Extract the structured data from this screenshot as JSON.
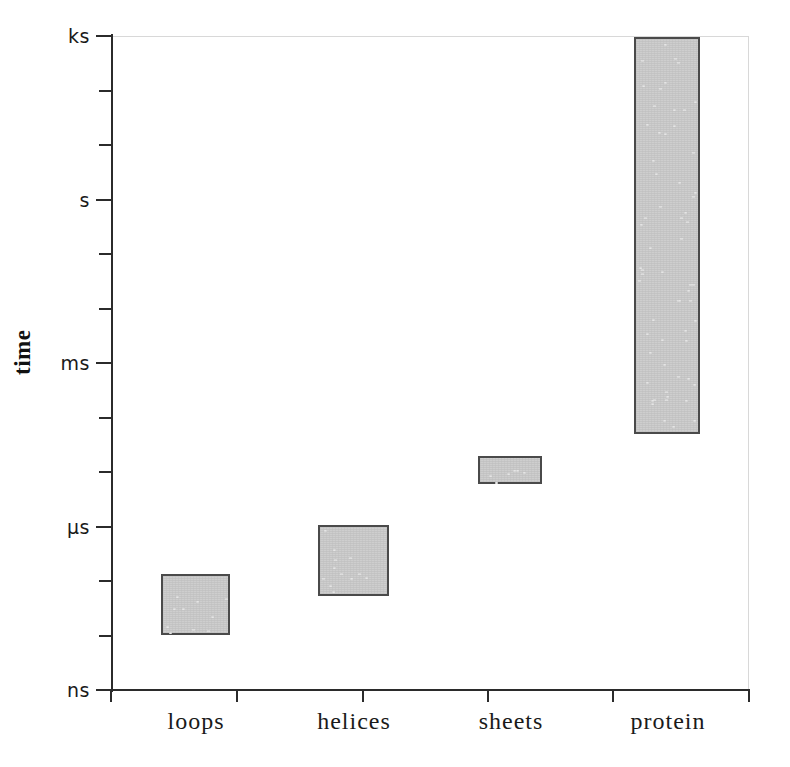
{
  "chart_data": {
    "type": "bar",
    "title": "",
    "subtitle": "",
    "xlabel": "",
    "ylabel": "time",
    "categories": [
      "loops",
      "helices",
      "sheets",
      "protein"
    ],
    "y_axis": {
      "scale": "log",
      "unit": "time",
      "major_tick_labels": [
        "ks",
        "s",
        "ms",
        "µs",
        "ns"
      ],
      "major_tick_values_log10_seconds": [
        3,
        0,
        -3,
        -6,
        -9
      ],
      "minor_ticks_per_major": 3,
      "ylim_labels": [
        "ns",
        "ks"
      ],
      "grid": false
    },
    "legend": {
      "present": false,
      "position": "none"
    },
    "series": [
      {
        "name": "folding time range",
        "ranges": [
          {
            "category": "loops",
            "low_label": "~100 ns",
            "high_label": "~1 µs",
            "low_log10_s": -7.0,
            "high_log10_s": -5.88
          },
          {
            "category": "helices",
            "low_label": "~1 µs",
            "high_label": "~10 µs",
            "low_log10_s": -6.1,
            "high_log10_s": -4.8
          },
          {
            "category": "sheets",
            "low_label": "~100 µs",
            "high_label": "~1 ms",
            "low_log10_s": -4.24,
            "high_log10_s": -3.73
          },
          {
            "category": "protein",
            "low_label": "~10 ms",
            "high_label": "~1 ks",
            "low_log10_s": -3.3,
            "high_log10_s": 2.98
          }
        ]
      }
    ],
    "colors": {
      "bar_fill": "#cecece",
      "bar_stroke": "#4a4a4a",
      "axis": "#2b2b2b",
      "text": "#1a1a1a",
      "frame": "#d8d8d8",
      "background": "#ffffff"
    }
  },
  "axis": {
    "y_ticks": [
      {
        "label": "ks",
        "y": 36,
        "major": true
      },
      {
        "label": "",
        "y": 91,
        "major": false
      },
      {
        "label": "",
        "y": 145,
        "major": false
      },
      {
        "label": "s",
        "y": 200,
        "major": true
      },
      {
        "label": "",
        "y": 254,
        "major": false
      },
      {
        "label": "",
        "y": 309,
        "major": false
      },
      {
        "label": "ms",
        "y": 363,
        "major": true
      },
      {
        "label": "",
        "y": 418,
        "major": false
      },
      {
        "label": "",
        "y": 472,
        "major": false
      },
      {
        "label": "µs",
        "y": 527,
        "major": true
      },
      {
        "label": "",
        "y": 581,
        "major": false
      },
      {
        "label": "",
        "y": 636,
        "major": false
      },
      {
        "label": "ns",
        "y": 690,
        "major": true
      }
    ],
    "x_ticks": [
      111,
      237,
      363,
      488,
      613,
      749
    ],
    "x_labels": [
      {
        "text": "loops",
        "x": 196
      },
      {
        "text": "helices",
        "x": 354
      },
      {
        "text": "sheets",
        "x": 511
      },
      {
        "text": "protein",
        "x": 668
      }
    ],
    "y_title": "time"
  },
  "bars": [
    {
      "name": "loops",
      "left": 161,
      "top": 574,
      "width": 69,
      "height": 61
    },
    {
      "name": "helices",
      "left": 318,
      "top": 525,
      "width": 71,
      "height": 71
    },
    {
      "name": "sheets",
      "left": 478,
      "top": 456,
      "width": 64,
      "height": 28
    },
    {
      "name": "protein",
      "left": 634,
      "top": 37,
      "width": 66,
      "height": 397
    }
  ]
}
